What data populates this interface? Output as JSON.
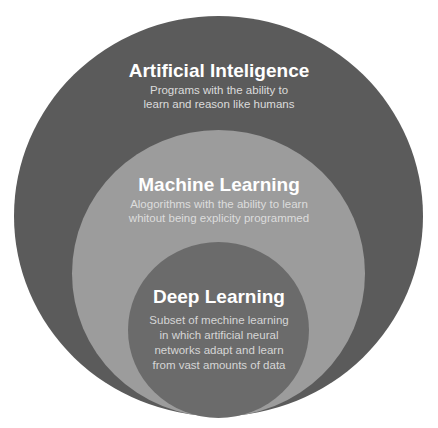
{
  "diagram": {
    "type": "nested-circles",
    "colors": {
      "outer": "#5b5b5b",
      "middle": "#9c9c9c",
      "inner": "#6b6b6b",
      "title_text": "#ffffff",
      "desc_text": "#dcdcdc"
    },
    "layers": [
      {
        "title": "Artificial Inteligence",
        "description_lines": [
          "Programs with the ability to",
          "learn and reason like humans"
        ]
      },
      {
        "title": "Machine Learning",
        "description_lines": [
          "Alogorithms with the ability to learn",
          "whitout being explicity programmed"
        ]
      },
      {
        "title": "Deep Learning",
        "description_lines": [
          "Subset of mechine learning",
          "in which artificial neural",
          "networks adapt and learn",
          "from vast amounts of data"
        ]
      }
    ]
  }
}
